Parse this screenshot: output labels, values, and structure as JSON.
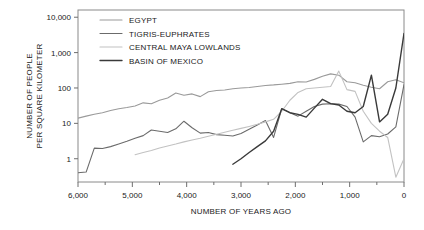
{
  "chart_data": {
    "type": "line",
    "title": "",
    "xlabel": "NUMBER OF YEARS AGO",
    "ylabel_line1": "NUMBER OF PEOPLE",
    "ylabel_line2": "PER SQUARE KILOMETER",
    "xlim": [
      6000,
      0
    ],
    "x_reversed": true,
    "xticks": [
      6000,
      5000,
      4000,
      3000,
      2000,
      1000,
      0
    ],
    "xtick_labels": [
      "6,000",
      "5,000",
      "4,000",
      "3,000",
      "2,000",
      "1,000",
      "0"
    ],
    "x_minor_ticks": [
      5500,
      4500,
      3500,
      2500,
      1500,
      500
    ],
    "yscale": "log",
    "ylim": [
      0.22,
      16000
    ],
    "yticks": [
      1,
      10,
      100,
      1000,
      10000
    ],
    "ytick_labels": [
      "1",
      "10",
      "100",
      "1,000",
      "10,000"
    ],
    "grid": false,
    "legend_position": "top-left-inside",
    "series": [
      {
        "name": "EGYPT",
        "color": "#9a9a9a",
        "width": 1.1,
        "x": [
          6000,
          5850,
          5700,
          5550,
          5400,
          5250,
          5100,
          4950,
          4800,
          4650,
          4500,
          4350,
          4200,
          4050,
          3900,
          3750,
          3600,
          3450,
          3300,
          3150,
          3000,
          2850,
          2700,
          2550,
          2400,
          2250,
          2100,
          1950,
          1800,
          1650,
          1500,
          1350,
          1200,
          1050,
          900,
          750,
          600,
          450,
          300,
          150,
          0
        ],
        "y": [
          14,
          16,
          18,
          20,
          23,
          26,
          28,
          31,
          38,
          36,
          45,
          52,
          72,
          62,
          68,
          57,
          78,
          85,
          88,
          95,
          100,
          103,
          110,
          118,
          122,
          128,
          135,
          150,
          148,
          175,
          215,
          250,
          230,
          150,
          140,
          120,
          105,
          95,
          150,
          170,
          140
        ]
      },
      {
        "name": "TIGRIS-EUPHRATES",
        "color": "#6b6b6b",
        "width": 1.1,
        "x": [
          6000,
          5850,
          5700,
          5550,
          5400,
          5250,
          5100,
          4950,
          4800,
          4650,
          4500,
          4350,
          4200,
          4050,
          3900,
          3750,
          3600,
          3450,
          3300,
          3150,
          3000,
          2850,
          2700,
          2550,
          2400,
          2250,
          2100,
          1950,
          1800,
          1650,
          1500,
          1350,
          1200,
          1050,
          900,
          750,
          600,
          450,
          300,
          150,
          0
        ],
        "y": [
          0.4,
          0.42,
          2.0,
          1.95,
          2.2,
          2.6,
          3.1,
          3.8,
          4.5,
          6.5,
          6.0,
          5.5,
          7.0,
          11.5,
          7.5,
          5.3,
          5.5,
          4.8,
          4.6,
          4.4,
          5.2,
          6.8,
          9.0,
          12.0,
          4.0,
          26,
          20,
          16,
          22,
          30,
          35,
          36,
          35,
          30,
          15,
          3.0,
          4.5,
          4.2,
          5.0,
          8.0,
          125
        ]
      },
      {
        "name": "CENTRAL MAYA LOWLANDS",
        "color": "#c2c2c2",
        "width": 1.1,
        "x": [
          4950,
          4800,
          4650,
          4500,
          4350,
          4200,
          4050,
          3900,
          3750,
          3600,
          3450,
          3300,
          3150,
          3000,
          2850,
          2700,
          2550,
          2400,
          2250,
          2100,
          1950,
          1800,
          1650,
          1500,
          1350,
          1200,
          1050,
          900,
          750,
          600,
          450,
          300,
          150,
          0
        ],
        "y": [
          1.3,
          1.5,
          1.7,
          2.0,
          2.3,
          2.6,
          3.0,
          3.4,
          3.8,
          4.3,
          4.9,
          5.6,
          6.4,
          7.2,
          8.2,
          9.4,
          11,
          13,
          22,
          45,
          75,
          95,
          100,
          105,
          110,
          300,
          90,
          80,
          22,
          10,
          6,
          4,
          0.3,
          1.0
        ]
      },
      {
        "name": "BASIN OF MEXICO",
        "color": "#3a3a3a",
        "width": 1.4,
        "x": [
          3150,
          3000,
          2850,
          2700,
          2550,
          2400,
          2250,
          2100,
          1950,
          1800,
          1650,
          1500,
          1350,
          1200,
          1050,
          900,
          750,
          600,
          450,
          300,
          150,
          0
        ],
        "y": [
          0.7,
          1.0,
          1.5,
          2.2,
          3.2,
          6.0,
          26,
          20,
          18,
          15,
          27,
          48,
          36,
          33,
          22,
          20,
          30,
          230,
          11,
          18,
          100,
          3500
        ]
      }
    ]
  },
  "legend": {
    "items": [
      {
        "label": "EGYPT"
      },
      {
        "label": "TIGRIS-EUPHRATES"
      },
      {
        "label": "CENTRAL MAYA LOWLANDS"
      },
      {
        "label": "BASIN OF MEXICO"
      }
    ]
  }
}
